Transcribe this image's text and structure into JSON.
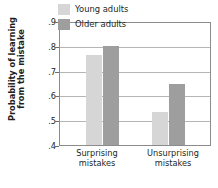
{
  "chart_data": {
    "type": "bar",
    "title": "",
    "xlabel": "",
    "ylabel_line1": "Probability of learning",
    "ylabel_line2": "from the mistake",
    "categories": [
      "Surprising mistakes",
      "Unsurprising mistakes"
    ],
    "category_lines": [
      [
        "Surprising",
        "mistakes"
      ],
      [
        "Unsurprising",
        "mistakes"
      ]
    ],
    "series": [
      {
        "name": "Young adults",
        "values": [
          0.77,
          0.535
        ],
        "color": "#d6d6d6"
      },
      {
        "name": "Older adults",
        "values": [
          0.805,
          0.65
        ],
        "color": "#9e9e9e"
      }
    ],
    "ylim": [
      0.4,
      0.9
    ],
    "yticks": [
      0.9,
      0.8,
      0.7,
      0.6,
      0.5,
      0.4
    ],
    "ytick_labels": [
      ".9",
      ".8",
      ".7",
      ".6",
      ".5",
      ".4"
    ],
    "grid": true,
    "grid_axis": "y",
    "legend_position": "top-right-inside"
  },
  "legend": {
    "entries": [
      {
        "label": "Young adults",
        "swatch": "#d6d6d6"
      },
      {
        "label": "Older adults",
        "swatch": "#9e9e9e"
      }
    ]
  },
  "colors": {
    "young": "#d6d6d6",
    "older": "#9e9e9e",
    "axis": "#8c8c8c",
    "grid": "#b5b5b5",
    "text": "#231f20"
  }
}
